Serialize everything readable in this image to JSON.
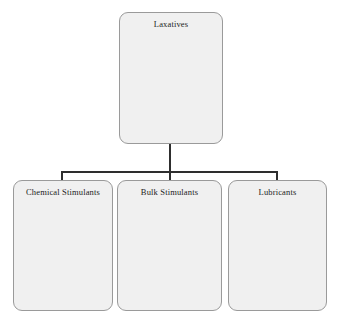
{
  "diagram": {
    "type": "hierarchy-tree",
    "orientation": "top-down",
    "background_color": "#ffffff",
    "node_fill_color": "#f0f0f0",
    "node_border_color": "#9a9a9a",
    "connector_color": "#2e2e2e",
    "root": {
      "id": "laxatives",
      "label": "Laxatives"
    },
    "children": [
      {
        "id": "chemical-stimulants",
        "label": "Chemical Stimulants"
      },
      {
        "id": "bulk-stimulants",
        "label": "Bulk Stimulants"
      },
      {
        "id": "lubricants",
        "label": "Lubricants"
      }
    ]
  }
}
